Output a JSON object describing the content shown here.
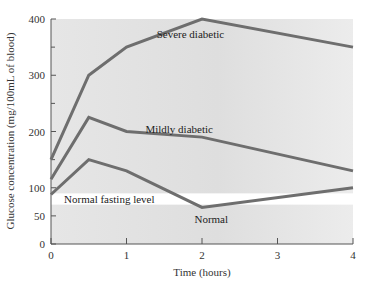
{
  "chart_data": {
    "type": "line",
    "title": "",
    "xlabel": "Time (hours)",
    "ylabel": "Glucose concentration (mg/100mL of blood)",
    "xlim": [
      0,
      4
    ],
    "ylim": [
      0,
      400
    ],
    "x_ticks": [
      0,
      1,
      2,
      3,
      4
    ],
    "y_ticks": [
      0,
      50,
      100,
      200,
      300,
      400
    ],
    "y_minor_ticks": [
      150,
      250,
      350
    ],
    "grid": false,
    "legend": "inline labels",
    "x": [
      0,
      0.5,
      1,
      2,
      4
    ],
    "series": [
      {
        "name": "Severe diabetic",
        "x": [
          0,
          0.5,
          1,
          2,
          4
        ],
        "values": [
          150,
          300,
          350,
          400,
          350
        ],
        "label_pos": [
          1.4,
          373
        ]
      },
      {
        "name": "Mildly diabetic",
        "x": [
          0,
          0.5,
          1,
          2,
          4
        ],
        "values": [
          115,
          225,
          200,
          190,
          130
        ],
        "label_pos": [
          1.25,
          205
        ]
      },
      {
        "name": "Normal",
        "x": [
          0,
          0.5,
          1,
          2,
          4
        ],
        "values": [
          88,
          150,
          130,
          65,
          100
        ],
        "label_pos": [
          1.9,
          45
        ]
      }
    ],
    "annotations": [
      {
        "text": "Normal fasting level",
        "type": "band",
        "y_range": [
          70,
          90
        ],
        "label_pos": [
          0.2,
          80
        ]
      }
    ],
    "colors": {
      "plot_bg": "#e2e2e2",
      "band": "#ffffff",
      "line": "#6e6e6e",
      "axis": "#555555"
    }
  }
}
